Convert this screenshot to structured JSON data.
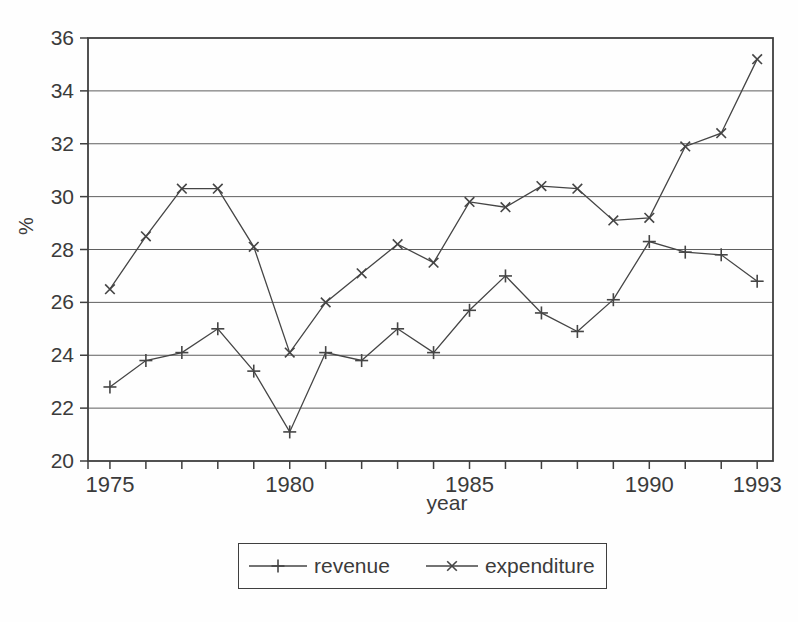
{
  "figure": {
    "xlabel": "year",
    "ylabel": "%"
  },
  "colors": {
    "ink": "#3b3b3b",
    "axis": "#3f3f3f",
    "grid": "#5f5f5f",
    "line": "#454545",
    "background": "#fefefe"
  },
  "chart_data": {
    "type": "line",
    "title": "",
    "xlabel": "year",
    "ylabel": "%",
    "x": [
      1975,
      1976,
      1977,
      1978,
      1979,
      1980,
      1981,
      1982,
      1983,
      1984,
      1985,
      1986,
      1987,
      1988,
      1989,
      1990,
      1991,
      1992,
      1993
    ],
    "series": [
      {
        "name": "revenue",
        "marker": "plus",
        "values": [
          22.8,
          23.8,
          24.1,
          25.0,
          23.4,
          21.1,
          24.1,
          23.8,
          25.0,
          24.1,
          25.7,
          27.0,
          25.6,
          24.9,
          26.1,
          28.3,
          27.9,
          27.8,
          26.8
        ]
      },
      {
        "name": "expenditure",
        "marker": "cross",
        "values": [
          26.5,
          28.5,
          30.3,
          30.3,
          28.1,
          24.1,
          26.0,
          27.1,
          28.2,
          27.5,
          29.8,
          29.6,
          30.4,
          30.3,
          29.1,
          29.2,
          31.9,
          32.4,
          35.2
        ]
      }
    ],
    "ylim": [
      20,
      36
    ],
    "y_tick_step": 2,
    "y_tick_labels": [
      "20",
      "22",
      "24",
      "26",
      "28",
      "30",
      "32",
      "34",
      "36"
    ],
    "x_labeled_ticks": [
      1975,
      1980,
      1985,
      1990,
      1993
    ],
    "x_tick_labels": [
      "1975",
      "1980",
      "1985",
      "1990",
      "1993"
    ],
    "grid": "horizontal",
    "legend_position": "bottom-box"
  }
}
